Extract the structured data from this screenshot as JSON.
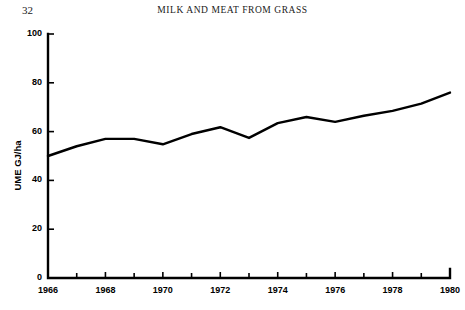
{
  "page": {
    "number": "32",
    "running_head": "MILK AND MEAT FROM GRASS"
  },
  "chart_data": {
    "type": "line",
    "title": "",
    "subtitle": "",
    "xlabel": "",
    "ylabel": "UME GJ/ha",
    "xlim": [
      1966,
      1980
    ],
    "ylim": [
      0,
      100
    ],
    "grid": false,
    "legend": null,
    "x_ticks_major": [
      1966,
      1968,
      1970,
      1972,
      1974,
      1976,
      1978,
      1980
    ],
    "x_ticks_minor": [
      1967,
      1969,
      1971,
      1973,
      1975,
      1977,
      1979
    ],
    "x_tick_labels": [
      "1966",
      "1968",
      "1970",
      "1972",
      "1974",
      "1976",
      "1978",
      "1980"
    ],
    "y_ticks": [
      0,
      20,
      40,
      60,
      80,
      100
    ],
    "y_tick_labels": [
      "0",
      "20",
      "40",
      "60",
      "80",
      "100"
    ],
    "x": [
      1966,
      1967,
      1968,
      1969,
      1970,
      1971,
      1972,
      1973,
      1974,
      1975,
      1976,
      1977,
      1978,
      1979,
      1980
    ],
    "series": [
      {
        "name": "UME GJ/ha",
        "color": "#000000",
        "line_width": 2.4,
        "values": [
          50.0,
          54.0,
          57.0,
          57.0,
          54.8,
          59.0,
          61.8,
          57.4,
          63.5,
          66.0,
          64.0,
          66.5,
          68.5,
          71.5,
          76.0
        ]
      }
    ]
  },
  "axes_geometry": {
    "left_px": 48,
    "right_px": 450,
    "top_px": 34,
    "bottom_px": 278,
    "tick_length_major": 6,
    "tick_length_minor": 5,
    "axis_width": 2.4
  }
}
